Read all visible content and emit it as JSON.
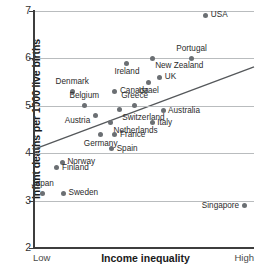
{
  "chart_data": {
    "type": "scatter",
    "title": "",
    "xlabel": "Income inequality",
    "ylabel": "Infant deaths per 1000 live births",
    "x_tick_labels": [
      "Low",
      "High"
    ],
    "y_ticks": [
      2,
      3,
      4,
      5,
      6,
      7
    ],
    "ylim": [
      2,
      7
    ],
    "xlim": [
      0,
      100
    ],
    "grid": "horizontal",
    "legend": "none",
    "point_color": "#6b6f73",
    "trendline": {
      "present": true,
      "color": "#55585b",
      "x_start": 0,
      "y_start": 4.09,
      "x_end": 100,
      "y_end": 5.82
    },
    "points": [
      {
        "label": "USA",
        "x": 78.0,
        "y": 6.91,
        "label_side": "right"
      },
      {
        "label": "Portugal",
        "x": 71.5,
        "y": 6.0,
        "label_side": "above"
      },
      {
        "label": "New Zealand",
        "x": 53.5,
        "y": 6.0,
        "label_side": "below-right"
      },
      {
        "label": "Ireland",
        "x": 42.0,
        "y": 5.9,
        "label_side": "below"
      },
      {
        "label": "UK",
        "x": 57.0,
        "y": 5.6,
        "label_side": "right"
      },
      {
        "label": "Israel",
        "x": 52.0,
        "y": 5.5,
        "label_side": "below"
      },
      {
        "label": "Denmark",
        "x": 17.0,
        "y": 5.31,
        "label_side": "above"
      },
      {
        "label": "Canada",
        "x": 36.5,
        "y": 5.31,
        "label_side": "right"
      },
      {
        "label": "Belgium",
        "x": 22.5,
        "y": 5.01,
        "label_side": "above"
      },
      {
        "label": "Greece",
        "x": 45.5,
        "y": 5.01,
        "label_side": "above"
      },
      {
        "label": "Australia",
        "x": 58.5,
        "y": 4.9,
        "label_side": "right"
      },
      {
        "label": "Switzerland",
        "x": 38.5,
        "y": 4.92,
        "label_side": "below-right"
      },
      {
        "label": "Austria",
        "x": 27.5,
        "y": 4.8,
        "label_side": "left-below"
      },
      {
        "label": "Italy",
        "x": 53.5,
        "y": 4.64,
        "label_side": "right"
      },
      {
        "label": "Netherlands",
        "x": 34.5,
        "y": 4.64,
        "label_side": "below-right"
      },
      {
        "label": "France",
        "x": 36.5,
        "y": 4.39,
        "label_side": "right"
      },
      {
        "label": "Germany",
        "x": 30.0,
        "y": 4.39,
        "label_side": "below"
      },
      {
        "label": "Spain",
        "x": 35.0,
        "y": 4.09,
        "label_side": "right"
      },
      {
        "label": "Norway",
        "x": 12.5,
        "y": 3.81,
        "label_side": "right"
      },
      {
        "label": "Finland",
        "x": 10.0,
        "y": 3.69,
        "label_side": "right"
      },
      {
        "label": "Japan",
        "x": 3.5,
        "y": 3.15,
        "label_side": "above"
      },
      {
        "label": "Sweden",
        "x": 13.0,
        "y": 3.15,
        "label_side": "right"
      },
      {
        "label": "Singapore",
        "x": 95.5,
        "y": 2.89,
        "label_side": "left"
      }
    ]
  }
}
